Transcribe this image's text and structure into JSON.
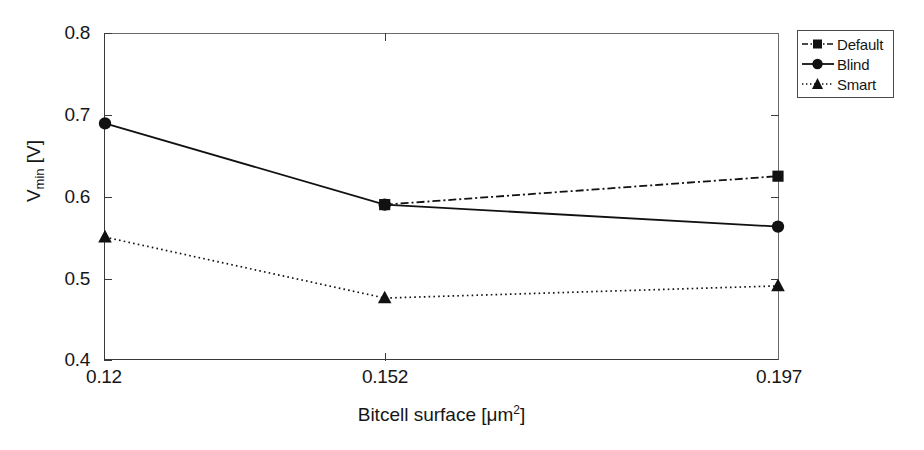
{
  "chart_data": {
    "type": "line",
    "title": "",
    "xlabel": "Bitcell surface [μm²]",
    "ylabel": "V_min [V]",
    "ylabel_base": "V",
    "ylabel_sub": "min",
    "ylabel_unit": " [V]",
    "xlabel_text": "Bitcell surface [μm",
    "xlabel_sup": "2",
    "xlabel_tail": "]",
    "x": [
      0.12,
      0.152,
      0.197
    ],
    "categories": [
      "0.12",
      "0.152",
      "0.197"
    ],
    "xtick_labels": [
      "0.12",
      "0.152",
      "0.197"
    ],
    "ytick_labels": [
      "0.8",
      "0.7",
      "0.6",
      "0.5",
      "0.4"
    ],
    "ytick_values": [
      0.8,
      0.7,
      0.6,
      0.5,
      0.4
    ],
    "ylim": [
      0.4,
      0.8
    ],
    "xlim": [
      0.12,
      0.197
    ],
    "grid": false,
    "legend_position": "top-right",
    "series": [
      {
        "name": "Default",
        "marker": "square",
        "linestyle": "dash-dot",
        "color": "#111111",
        "x": [
          0.152,
          0.197
        ],
        "values": [
          0.59,
          0.625
        ]
      },
      {
        "name": "Blind",
        "marker": "circle",
        "linestyle": "solid",
        "color": "#111111",
        "x": [
          0.12,
          0.152,
          0.197
        ],
        "values": [
          0.69,
          0.59,
          0.563
        ]
      },
      {
        "name": "Smart",
        "marker": "triangle",
        "linestyle": "dotted",
        "color": "#111111",
        "x": [
          0.12,
          0.152,
          0.197
        ],
        "values": [
          0.55,
          0.475,
          0.49
        ]
      }
    ]
  },
  "legend": {
    "items": [
      {
        "label": "Default"
      },
      {
        "label": "Blind"
      },
      {
        "label": "Smart"
      }
    ]
  },
  "axes": {
    "y_ticks": [
      {
        "label": "0.8"
      },
      {
        "label": "0.7"
      },
      {
        "label": "0.6"
      },
      {
        "label": "0.5"
      },
      {
        "label": "0.4"
      }
    ],
    "x_ticks": [
      {
        "label": "0.12"
      },
      {
        "label": "0.152"
      },
      {
        "label": "0.197"
      }
    ]
  }
}
